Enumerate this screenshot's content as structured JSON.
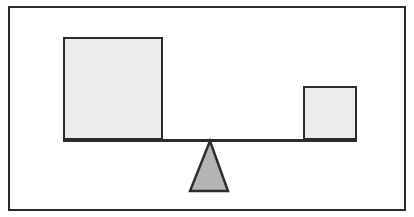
{
  "figure": {
    "title": "Balance scale with two weights on a beam over a triangular fulcrum",
    "caption": "",
    "background_color": "#ffffff",
    "border_color": "#2b2b2b",
    "border_width_px": 2
  },
  "chart_data": {
    "type": "diagram",
    "title": "Balance scale with two weights on a beam over a triangular fulcrum",
    "subtitle": "",
    "xlabel": "",
    "ylabel": "",
    "grid": false,
    "legend": "none",
    "background": "#ffffff",
    "canvas": {
      "width": 414,
      "height": 217
    },
    "frame": {
      "x": 8,
      "y": 6,
      "width": 398,
      "height": 205,
      "stroke": "#2b2b2b",
      "stroke_width": 2,
      "fill": "#ffffff"
    },
    "elements": [
      {
        "id": "large-block",
        "name": "large-square-weight",
        "shape": "rectangle",
        "label": "",
        "x": 63,
        "y": 37,
        "width": 100,
        "height": 103,
        "fill": "#ececec",
        "stroke": "#2b2b2b",
        "stroke_width": 2,
        "side_length": 100,
        "rests_on": "beam",
        "side": "left"
      },
      {
        "id": "small-block",
        "name": "small-square-weight",
        "shape": "rectangle",
        "label": "",
        "x": 303,
        "y": 86,
        "width": 54,
        "height": 54,
        "fill": "#ececec",
        "stroke": "#2b2b2b",
        "stroke_width": 2,
        "side_length": 54,
        "rests_on": "beam",
        "side": "right"
      },
      {
        "id": "beam",
        "name": "balance-beam",
        "shape": "line",
        "label": "",
        "x": 63,
        "y": 139,
        "width": 294,
        "height": 3,
        "fill": "#2b2b2b",
        "stroke": "#2b2b2b",
        "stroke_width": 3,
        "x1": 63,
        "x2": 357,
        "orientation": "horizontal"
      },
      {
        "id": "fulcrum",
        "name": "triangular-fulcrum",
        "shape": "triangle",
        "label": "",
        "apex_x": 210,
        "apex_y": 141,
        "base_left_x": 190,
        "base_right_x": 228,
        "base_y": 191,
        "fill": "#b4b4b4",
        "stroke": "#2b2b2b",
        "stroke_width": 2,
        "base_width": 38,
        "height": 50
      }
    ],
    "annotations": [],
    "colors": {
      "block_fill": "#ececec",
      "fulcrum_fill": "#b4b4b4",
      "outline": "#2b2b2b",
      "background": "#ffffff"
    }
  }
}
